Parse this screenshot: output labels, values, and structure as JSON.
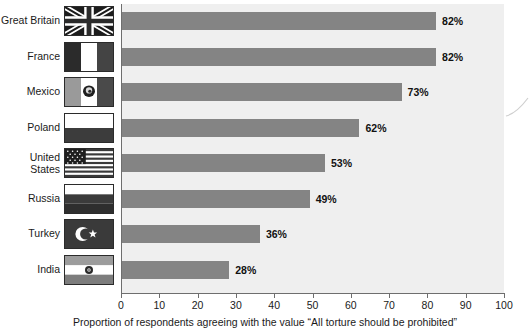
{
  "chart_data": {
    "type": "bar",
    "orientation": "horizontal",
    "title": "",
    "xlabel": "Proportion of respondents agreeing with the value “All torture should be prohibited”",
    "ylabel": "",
    "xlim": [
      0,
      100
    ],
    "xticks": [
      0,
      10,
      20,
      30,
      40,
      50,
      60,
      70,
      80,
      90,
      100
    ],
    "grid": false,
    "legend": null,
    "bar_color": "#848484",
    "plot_background": "#efefef",
    "categories": [
      "Great Britain",
      "France",
      "Mexico",
      "Poland",
      "United\nStates",
      "Russia",
      "Turkey",
      "India"
    ],
    "values": [
      82,
      82,
      73,
      62,
      53,
      49,
      36,
      28
    ],
    "value_labels": [
      "82%",
      "82%",
      "73%",
      "62%",
      "53%",
      "49%",
      "36%",
      "28%"
    ],
    "series": [
      {
        "name": "Proportion agreeing",
        "values": [
          82,
          82,
          73,
          62,
          53,
          49,
          36,
          28
        ]
      }
    ],
    "rows": [
      {
        "category": "Great Britain",
        "label": "Great Britain",
        "value": 82,
        "value_label": "82%",
        "flag": "flag-great-britain"
      },
      {
        "category": "France",
        "label": "France",
        "value": 82,
        "value_label": "82%",
        "flag": "flag-france"
      },
      {
        "category": "Mexico",
        "label": "Mexico",
        "value": 73,
        "value_label": "73%",
        "flag": "flag-mexico"
      },
      {
        "category": "Poland",
        "label": "Poland",
        "value": 62,
        "value_label": "62%",
        "flag": "flag-poland"
      },
      {
        "category": "United States",
        "label": "United\nStates",
        "value": 53,
        "value_label": "53%",
        "flag": "flag-united-states"
      },
      {
        "category": "Russia",
        "label": "Russia",
        "value": 49,
        "value_label": "49%",
        "flag": "flag-russia"
      },
      {
        "category": "Turkey",
        "label": "Turkey",
        "value": 36,
        "value_label": "36%",
        "flag": "flag-turkey"
      },
      {
        "category": "India",
        "label": "India",
        "value": 28,
        "value_label": "28%",
        "flag": "flag-india"
      }
    ],
    "xtick_labels": [
      "0",
      "10",
      "20",
      "30",
      "40",
      "50",
      "60",
      "70",
      "80",
      "90",
      "100"
    ]
  },
  "caption": "Proportion of respondents agreeing with the value “All torture should be prohibited”"
}
